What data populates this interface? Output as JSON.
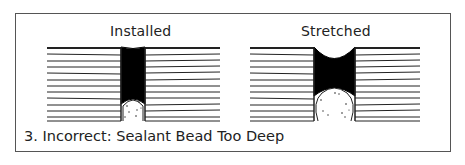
{
  "diagram": {
    "panels": [
      {
        "title": "Installed",
        "state": "joint at rest, sealant column with backer rod below"
      },
      {
        "title": "Stretched",
        "state": "joint widened, sealant necks inward at top"
      }
    ],
    "caption": "3. Incorrect: Sealant Bead Too Deep",
    "colors": {
      "sealant": "#000000",
      "lines": "#222222",
      "frame": "#555555",
      "backer_rod": "#ffffff"
    }
  }
}
